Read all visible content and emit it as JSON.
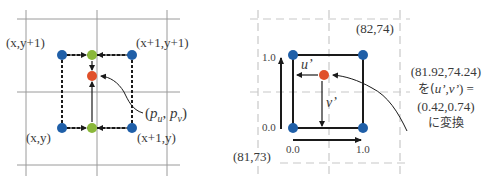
{
  "colors": {
    "grid": "#9a9a9a",
    "grid_dashed": "#c8c8c8",
    "corner_point": "#1f5fa8",
    "interp_point": "#8ab83a",
    "target_point": "#e0502a",
    "line": "#1a1a1a"
  },
  "left_diagram": {
    "corner_labels": {
      "top_left": "(x,y+1)",
      "top_right": "(x+1,y+1)",
      "bottom_left": "(x,y)",
      "bottom_right": "(x+1,y)"
    },
    "target_label": {
      "open": "(",
      "pu_base": "p",
      "pu_sub": "u",
      "sep": ", ",
      "pv_base": "p",
      "pv_sub": "v",
      "close": ")"
    }
  },
  "right_diagram": {
    "corner_label_top_right": "(82,74)",
    "corner_label_bottom_left": "(81,73)",
    "v_axis_ticks": {
      "top": "1.0",
      "bottom": "0.0"
    },
    "u_axis_ticks": {
      "left": "0.0",
      "right": "1.0"
    },
    "u_label": "u’",
    "v_label": "v’",
    "note": {
      "line1": "(81.92,74.24)",
      "line2_prefix": "を(",
      "line2_vars": "u’,v’",
      "line2_suffix": ") =",
      "line3": "(0.42,0.74)",
      "line4": "に変換"
    }
  }
}
